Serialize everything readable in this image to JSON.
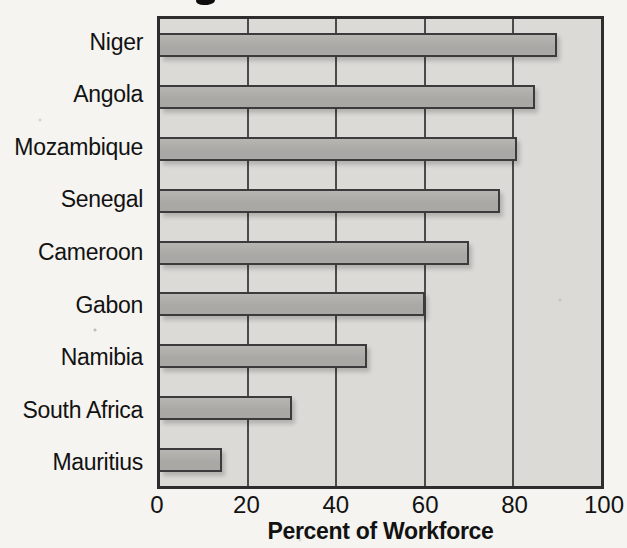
{
  "chart_data": {
    "type": "bar",
    "orientation": "horizontal",
    "categories": [
      "Niger",
      "Angola",
      "Mozambique",
      "Senegal",
      "Cameroon",
      "Gabon",
      "Namibia",
      "South Africa",
      "Mauritius"
    ],
    "values": [
      90,
      85,
      81,
      77,
      70,
      60,
      47,
      30,
      14
    ],
    "xlabel": "Percent of Workforce",
    "x_ticks": [
      0,
      20,
      40,
      60,
      80,
      100
    ],
    "xlim": [
      0,
      100
    ],
    "grid": "vertical-on",
    "legend": "none",
    "note": "top of figure title cropped out of screenshot",
    "colors": {
      "paper": "#f5f4f0",
      "plot_bg": "#dbdad6",
      "bar_fill": "#a9a8a4",
      "bar_fill_light": "#b7b6b2",
      "bar_border": "#3b3b3b",
      "gridline": "#4b4b4b",
      "frame": "#2d2d2d",
      "text": "#121212"
    }
  }
}
